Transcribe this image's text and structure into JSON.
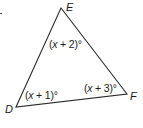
{
  "figure": {
    "type": "triangle",
    "name": "Triangle DEF",
    "stroke_color": "#2a2a2a",
    "vertices": [
      {
        "label": "D",
        "x": 16,
        "y": 107
      },
      {
        "label": "E",
        "x": 61,
        "y": 8
      },
      {
        "label": "F",
        "x": 127,
        "y": 94
      }
    ],
    "angles": [
      {
        "vertex": "E",
        "open": "(",
        "var": "x",
        "op": " + ",
        "num": "2",
        "close": ")°",
        "text": "(x + 2)°"
      },
      {
        "vertex": "D",
        "open": "(",
        "var": "x",
        "op": " + ",
        "num": "1",
        "close": ")°",
        "text": "(x + 1)°"
      },
      {
        "vertex": "F",
        "open": "(",
        "var": "x",
        "op": " + ",
        "num": "3",
        "close": ")°",
        "text": "(x + 3)°"
      }
    ]
  }
}
